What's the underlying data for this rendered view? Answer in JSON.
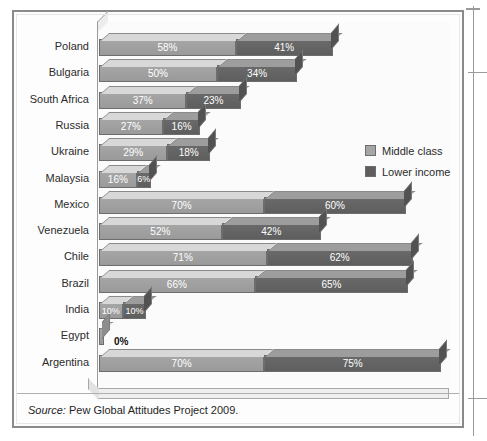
{
  "page": {
    "top_cut_text": "            "
  },
  "figure": {
    "source_key": "Source:",
    "source_text": " Pew Global Attitudes Project 2009."
  },
  "legend": {
    "items": [
      {
        "label": "Middle class",
        "color": "#a6a6a6"
      },
      {
        "label": "Lower income",
        "color": "#5e5e5e"
      }
    ]
  },
  "chart_data": {
    "type": "bar",
    "orientation": "horizontal",
    "stacked": true,
    "three_d": true,
    "title": "",
    "subtitle": "",
    "xlabel": "",
    "ylabel": "",
    "grid": false,
    "legend_position": "inside-right",
    "value_suffix": "%",
    "xlim": [
      0,
      150
    ],
    "categories": [
      "Poland",
      "Bulgaria",
      "South Africa",
      "Russia",
      "Ukraine",
      "Malaysia",
      "Mexico",
      "Venezuela",
      "Chile",
      "Brazil",
      "India",
      "Egypt",
      "Argentina"
    ],
    "series": [
      {
        "name": "Middle class",
        "color": "#a6a6a6",
        "values": [
          58,
          50,
          37,
          27,
          29,
          16,
          70,
          52,
          71,
          66,
          10,
          0,
          70
        ],
        "labels": [
          "58%",
          "50%",
          "37%",
          "27%",
          "29%",
          "16%",
          "70%",
          "52%",
          "71%",
          "66%",
          "10%",
          "0%",
          "70%"
        ]
      },
      {
        "name": "Lower income",
        "color": "#5e5e5e",
        "values": [
          41,
          34,
          23,
          16,
          18,
          6,
          60,
          42,
          62,
          65,
          10,
          0,
          75
        ],
        "labels": [
          "41%",
          "34%",
          "23%",
          "16%",
          "18%",
          "6%",
          "60%",
          "42%",
          "62%",
          "65%",
          "10%",
          "",
          "75%"
        ]
      }
    ],
    "notes": [
      "Egypt shows a 0% label placed outside the bar in black text.",
      "Egypt has no lower-income segment drawn."
    ]
  }
}
